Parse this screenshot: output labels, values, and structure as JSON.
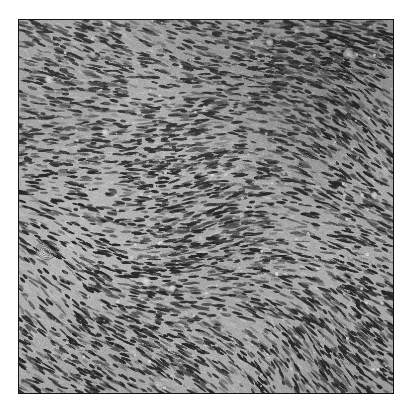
{
  "figure": {
    "kind": "photomicrograph",
    "caption_visible": "",
    "alt_text": "Grayscale histopathology photomicrograph of a spindle cell neoplasm arranged in interlacing fascicles",
    "border_color": "#141414",
    "border_width_px": 1,
    "page_background": "#ffffff",
    "plate": {
      "x": 18,
      "y": 19,
      "width": 376,
      "height": 375
    }
  },
  "image_content": {
    "modality": "light-microscopy",
    "stain": "hematoxylin-and-eosin-grayscale",
    "color_mode": "grayscale",
    "tissue_pattern": "interlacing-spindle-cell-fascicles",
    "tone": {
      "background_gray": "#9a9a9a",
      "cytoplasm_gray": "#b4b4b4",
      "nuclei_dark": "#1f1f1f",
      "nuclei_mid": "#4a4a4a",
      "highlight_white": "#f2f2f2",
      "min_gray": "#101010",
      "max_gray": "#f5f5f5"
    },
    "regions": [
      {
        "name": "upper-left-fascicle-band",
        "orientation_deg": -12,
        "density": "moderate",
        "note": "nuclei sweep from lower-left toward upper-right"
      },
      {
        "name": "upper-right-dense-zone",
        "orientation_deg": 28,
        "density": "high",
        "note": "darker hypercellular area with small vessel lumina"
      },
      {
        "name": "mid-horizontal-fascicles",
        "orientation_deg": -4,
        "density": "moderate",
        "note": "long horizontal streaming bundles across the centre"
      },
      {
        "name": "lower-left-diagonal-fascicles",
        "orientation_deg": 38,
        "density": "moderate",
        "note": "bundles run upper-left to lower-right"
      },
      {
        "name": "lower-right-diagonal-fascicles",
        "orientation_deg": 34,
        "density": "moderate-high",
        "note": "parallel diagonal streaming toward lower-right corner"
      }
    ],
    "features": [
      {
        "name": "vessel-lumen",
        "x_pct": 6,
        "y_pct": 63,
        "size_px": 9
      },
      {
        "name": "vessel-lumen",
        "x_pct": 8,
        "y_pct": 16,
        "size_px": 7
      },
      {
        "name": "vessel-lumen",
        "x_pct": 34,
        "y_pct": 70,
        "size_px": 8
      },
      {
        "name": "vessel-lumen",
        "x_pct": 41,
        "y_pct": 72,
        "size_px": 6
      },
      {
        "name": "vessel-lumen",
        "x_pct": 67,
        "y_pct": 6,
        "size_px": 7
      },
      {
        "name": "vessel-lumen",
        "x_pct": 88,
        "y_pct": 9,
        "size_px": 9
      },
      {
        "name": "vessel-lumen",
        "x_pct": 95,
        "y_pct": 47,
        "size_px": 6
      },
      {
        "name": "vessel-lumen",
        "x_pct": 23,
        "y_pct": 30,
        "size_px": 6
      },
      {
        "name": "whorl",
        "x_pct": 7,
        "y_pct": 62,
        "size_px": 18
      }
    ]
  },
  "texture_params": {
    "nucleus_count": 9200,
    "nucleus_length_px": [
      5,
      13
    ],
    "nucleus_width_px": [
      1.6,
      3.2
    ],
    "grain_opacity": 0.3,
    "blur_px": 0.45,
    "seed": 20240817
  }
}
